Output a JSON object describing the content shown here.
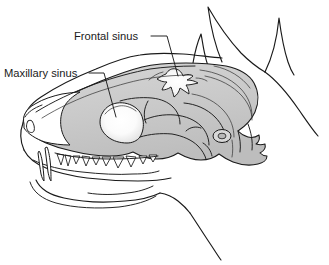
{
  "figure": {
    "background_color": "#ffffff",
    "bone_fill_color": "#cbcbcb",
    "outline_color": "#1a1a1a",
    "sinus_fill_color": "#ffffff",
    "width": 329,
    "height": 265
  },
  "labels": [
    {
      "id": "frontal-sinus",
      "text": "Frontal sinus",
      "text_x": 74,
      "text_y": 40,
      "leader_points": "151,36 167,36 178,76",
      "anchor_x": 178,
      "anchor_y": 76
    },
    {
      "id": "maxillary-sinus",
      "text": "Maxillary sinus",
      "text_x": 4,
      "text_y": 77,
      "leader_points": "89,73 104,73 116,117",
      "anchor_x": 116,
      "anchor_y": 117
    }
  ],
  "structures": [
    {
      "id": "cranium",
      "name": "Cranium"
    },
    {
      "id": "frontal-sinus-cavity",
      "name": "Frontal sinus"
    },
    {
      "id": "maxillary-sinus-cavity",
      "name": "Maxillary sinus"
    },
    {
      "id": "nasal-bone",
      "name": "Nasal bone"
    },
    {
      "id": "maxilla",
      "name": "Maxilla"
    },
    {
      "id": "mandible",
      "name": "Mandible"
    },
    {
      "id": "zygomatic-arch",
      "name": "Zygomatic arch"
    },
    {
      "id": "occipital",
      "name": "Occipital region"
    },
    {
      "id": "external-ear-canal",
      "name": "External ear canal"
    },
    {
      "id": "upper-canine-tooth",
      "name": "Upper canine tooth"
    },
    {
      "id": "lower-canine-tooth",
      "name": "Lower canine tooth"
    },
    {
      "id": "upper-tooth-row",
      "name": "Upper tooth row"
    },
    {
      "id": "ear-near",
      "name": "Near ear pinna"
    },
    {
      "id": "ear-far",
      "name": "Far ear pinna"
    },
    {
      "id": "head-skin-outline",
      "name": "Head skin outline"
    },
    {
      "id": "neck-outline",
      "name": "Neck outline"
    },
    {
      "id": "throat-outline",
      "name": "Throat outline"
    },
    {
      "id": "muzzle-outline",
      "name": "Muzzle outline"
    }
  ]
}
